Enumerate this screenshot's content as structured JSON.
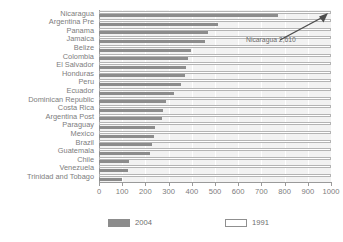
{
  "chart_data": {
    "type": "bar",
    "orientation": "horizontal",
    "title": "",
    "xlabel": "",
    "ylabel": "",
    "xlim": [
      0,
      1000
    ],
    "xticks": [
      "0",
      "100",
      "200",
      "300",
      "400",
      "500",
      "600",
      "700",
      "800",
      "900",
      "1000"
    ],
    "grid": true,
    "legend_position": "bottom",
    "categories": [
      "Nicaragua",
      "Argentina Pre",
      "Panama",
      "Jamaica",
      "Belize",
      "Colombia",
      "El Salvador",
      "Honduras",
      "Peru",
      "Ecuador",
      "Dominican Republic",
      "Costa Rica",
      "Argentina Post",
      "Paraguay",
      "Mexico",
      "Brazil",
      "Guatemala",
      "Chile",
      "Venezuela",
      "Trinidad and Tobago"
    ],
    "series": [
      {
        "name": "2004",
        "color": "#8c8c8c",
        "values": [
          770,
          515,
          470,
          455,
          395,
          385,
          375,
          370,
          355,
          325,
          290,
          275,
          270,
          240,
          235,
          230,
          220,
          130,
          125,
          100
        ]
      },
      {
        "name": "1991",
        "color": "#ffffff",
        "values": [
          1000,
          1000,
          1000,
          1000,
          1000,
          1000,
          1000,
          1000,
          1000,
          1000,
          1000,
          1000,
          1000,
          1000,
          1000,
          1000,
          1000,
          1000,
          1000,
          1000
        ]
      }
    ],
    "annotations": [
      {
        "text": "Nicaragua  2,610",
        "target_category": "Nicaragua"
      }
    ]
  },
  "legend": {
    "items": [
      {
        "label": "2004",
        "style": "filled"
      },
      {
        "label": "1991",
        "style": "hollow"
      }
    ]
  },
  "annotation": {
    "text": "Nicaragua  2,610"
  }
}
